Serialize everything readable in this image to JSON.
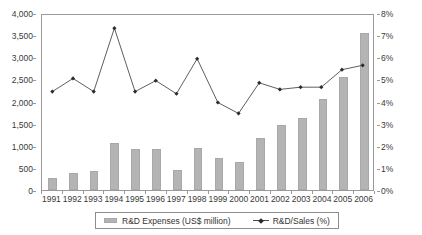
{
  "chart_data": {
    "type": "bar",
    "title": "",
    "subtitle": "",
    "xlabel": "",
    "ylabel": "",
    "grid": false,
    "legend_position": "bottom",
    "categories": [
      "1991",
      "1992",
      "1993",
      "1994",
      "1995",
      "1996",
      "1997",
      "1998",
      "1999",
      "2000",
      "2001",
      "2002",
      "2003",
      "2004",
      "2005",
      "2006"
    ],
    "series": [
      {
        "name": "R&D Expenses (US$ million)",
        "type": "bar",
        "axis": "left",
        "color": "#b4b4b4",
        "values": [
          280,
          380,
          440,
          1060,
          930,
          920,
          450,
          960,
          720,
          640,
          1180,
          1480,
          1630,
          2060,
          2550,
          3550
        ]
      },
      {
        "name": "R&D/Sales (%)",
        "type": "line",
        "axis": "right",
        "color": "#4a4a4a",
        "marker": "diamond",
        "values": [
          4.5,
          5.1,
          4.5,
          7.4,
          4.5,
          5.0,
          4.4,
          6.0,
          4.0,
          3.5,
          4.9,
          4.6,
          4.7,
          4.7,
          5.5,
          5.7
        ]
      }
    ],
    "left_axis": {
      "ylim": [
        0,
        4000
      ],
      "tick_step": 500,
      "ticks": [
        "0",
        "500",
        "1,000",
        "1,500",
        "2,000",
        "2,500",
        "3,000",
        "3,500",
        "4,000"
      ],
      "tick_values": [
        0,
        500,
        1000,
        1500,
        2000,
        2500,
        3000,
        3500,
        4000
      ]
    },
    "right_axis": {
      "ylim": [
        0,
        8
      ],
      "tick_step": 1,
      "ticks": [
        "0%",
        "1%",
        "2%",
        "3%",
        "4%",
        "5%",
        "6%",
        "7%",
        "8%"
      ],
      "tick_values": [
        0,
        1,
        2,
        3,
        4,
        5,
        6,
        7,
        8
      ]
    },
    "legend": [
      {
        "label": "R&D Expenses (US$ million)",
        "marker": "bar-swatch",
        "color": "#b4b4b4"
      },
      {
        "label": "R&D/Sales (%)",
        "marker": "line-diamond",
        "color": "#4a4a4a"
      }
    ]
  }
}
